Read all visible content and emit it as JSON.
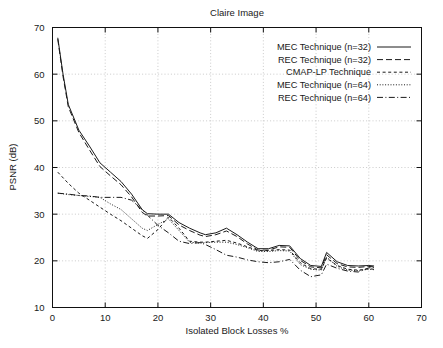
{
  "chart_data": {
    "type": "line",
    "title": "Claire Image",
    "xlabel": "Isolated Block Losses %",
    "ylabel": "PSNR (dB)",
    "xlim": [
      0,
      70
    ],
    "ylim": [
      10,
      70
    ],
    "xticks": [
      0,
      10,
      20,
      30,
      40,
      50,
      60,
      70
    ],
    "yticks": [
      10,
      20,
      30,
      40,
      50,
      60,
      70
    ],
    "grid": true,
    "legend_position": "top-right",
    "series": [
      {
        "name": "MEC Technique (n=32)",
        "linestyle": "solid",
        "x": [
          1,
          2,
          3,
          5,
          7,
          9,
          11,
          13,
          15,
          17,
          18,
          20,
          22,
          24,
          26,
          28,
          29,
          31,
          33,
          35,
          37,
          39,
          41,
          43,
          45,
          47,
          49,
          51,
          52,
          54,
          56,
          58,
          60,
          61
        ],
        "y": [
          67.8,
          60.0,
          53.5,
          48.0,
          44.6,
          41.0,
          39.0,
          37.0,
          34.3,
          31.0,
          30.1,
          30.0,
          30.0,
          28.2,
          27.0,
          26.0,
          25.6,
          26.0,
          27.0,
          25.6,
          24.0,
          22.6,
          22.6,
          23.3,
          23.2,
          20.5,
          19.0,
          18.8,
          21.8,
          19.8,
          19.0,
          18.9,
          19.0,
          18.9
        ]
      },
      {
        "name": "REC Technique (n=32)",
        "linestyle": "dashed",
        "x": [
          1,
          2,
          3,
          5,
          7,
          9,
          11,
          13,
          15,
          17,
          18,
          20,
          22,
          24,
          26,
          28,
          29,
          31,
          33,
          35,
          37,
          39,
          41,
          43,
          45,
          47,
          49,
          51,
          52,
          54,
          56,
          58,
          60,
          61
        ],
        "y": [
          67.5,
          59.5,
          53.0,
          47.5,
          43.8,
          40.2,
          38.2,
          36.3,
          33.7,
          30.4,
          29.6,
          29.6,
          29.7,
          27.7,
          26.5,
          25.5,
          25.2,
          25.6,
          26.4,
          25.2,
          23.6,
          22.3,
          22.3,
          23.0,
          22.9,
          20.1,
          18.7,
          18.5,
          21.3,
          19.4,
          18.7,
          18.6,
          18.8,
          18.7
        ]
      },
      {
        "name": "CMAP-LP Technique",
        "linestyle": "dashed2",
        "x": [
          1,
          3,
          5,
          7,
          9,
          11,
          13,
          15,
          17,
          18,
          20,
          22,
          24,
          26,
          28,
          29,
          31,
          33,
          35,
          37,
          39,
          41,
          43,
          45,
          47,
          49,
          51,
          52,
          54,
          56,
          58,
          60,
          61
        ],
        "y": [
          39.0,
          36.6,
          34.5,
          33.0,
          31.5,
          30.0,
          28.6,
          27.0,
          25.4,
          24.8,
          26.7,
          29.4,
          27.0,
          24.2,
          24.0,
          24.0,
          24.2,
          24.4,
          23.8,
          23.0,
          22.2,
          22.2,
          22.4,
          22.3,
          19.6,
          18.3,
          18.2,
          20.6,
          19.0,
          18.2,
          18.0,
          18.3,
          18.2
        ]
      },
      {
        "name": "MEC Technique (n=64)",
        "linestyle": "dotted",
        "x": [
          1,
          3,
          5,
          7,
          9,
          11,
          13,
          15,
          17,
          18,
          20,
          22,
          24,
          26,
          28,
          29,
          31,
          33,
          35,
          37,
          39,
          41,
          43,
          45,
          47,
          49,
          51,
          52,
          54,
          56,
          58,
          60,
          61
        ],
        "y": [
          34.5,
          34.2,
          34.0,
          33.8,
          33.6,
          32.2,
          31.0,
          29.0,
          27.0,
          26.5,
          27.8,
          29.0,
          26.5,
          24.0,
          23.8,
          23.9,
          24.0,
          24.0,
          23.5,
          22.8,
          22.0,
          22.0,
          22.2,
          22.1,
          19.2,
          18.2,
          18.0,
          20.8,
          18.8,
          18.0,
          17.9,
          18.2,
          18.1
        ]
      },
      {
        "name": "REC Technique (n=64)",
        "linestyle": "dashdot",
        "x": [
          1,
          3,
          5,
          7,
          9,
          11,
          13,
          15,
          17,
          18,
          20,
          22,
          24,
          26,
          28,
          29,
          31,
          33,
          35,
          37,
          39,
          41,
          43,
          45,
          47,
          49,
          51,
          52,
          54,
          56,
          58,
          60,
          61
        ],
        "y": [
          34.5,
          34.3,
          34.0,
          33.9,
          33.6,
          33.6,
          33.6,
          33.0,
          31.0,
          29.8,
          27.6,
          26.0,
          24.2,
          23.7,
          23.9,
          23.5,
          22.4,
          21.2,
          20.8,
          20.2,
          19.8,
          19.6,
          19.8,
          20.3,
          18.0,
          16.6,
          17.0,
          19.3,
          18.4,
          17.8,
          17.6,
          18.5,
          18.6
        ]
      }
    ]
  },
  "legend": {
    "items": [
      {
        "label": "MEC Technique (n=32)",
        "style": "solid"
      },
      {
        "label": "REC Technique (n=32)",
        "style": "dashed"
      },
      {
        "label": "CMAP-LP Technique",
        "style": "dashed2"
      },
      {
        "label": "MEC Technique (n=64)",
        "style": "dotted"
      },
      {
        "label": "REC Technique (n=64)",
        "style": "dashdot"
      }
    ]
  },
  "caption": {
    "text": ""
  }
}
